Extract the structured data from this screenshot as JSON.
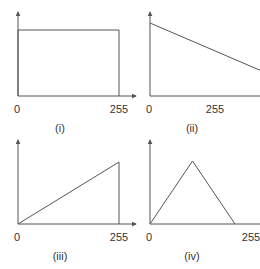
{
  "colors": {
    "axis": "#555555",
    "line": "#555555",
    "text": "#333333",
    "background": "#ffffff"
  },
  "chart_data": [
    {
      "type": "line",
      "caption": "(i)",
      "title": "",
      "xlabel": "",
      "ylabel": "",
      "x_tick_labels": [
        "0",
        "255"
      ],
      "x": [
        0,
        0,
        255,
        255
      ],
      "y": [
        0,
        1,
        1,
        0
      ],
      "xlim": [
        0,
        290
      ],
      "ylim": [
        0,
        1.2
      ],
      "grid": false,
      "description": "constant (uniform) function over 0-255"
    },
    {
      "type": "line",
      "caption": "(ii)",
      "title": "",
      "xlabel": "",
      "ylabel": "",
      "x_tick_labels": [
        "0",
        "255"
      ],
      "x": [
        0,
        510
      ],
      "y": [
        1,
        0
      ],
      "xlim": [
        0,
        580
      ],
      "ylim": [
        0,
        1.2
      ],
      "grid": false,
      "description": "linearly decreasing function reaching zero beyond the 255 tick"
    },
    {
      "type": "line",
      "caption": "(iii)",
      "title": "",
      "xlabel": "",
      "ylabel": "",
      "x_tick_labels": [
        "0",
        "255"
      ],
      "x": [
        0,
        255,
        255
      ],
      "y": [
        0,
        1,
        0
      ],
      "xlim": [
        0,
        290
      ],
      "ylim": [
        0,
        1.2
      ],
      "grid": false,
      "description": "linearly increasing function from 0 to 255"
    },
    {
      "type": "line",
      "caption": "(iv)",
      "title": "",
      "xlabel": "",
      "ylabel": "",
      "x_tick_labels": [
        "0",
        "255"
      ],
      "x": [
        0,
        127.5,
        255
      ],
      "y": [
        0,
        1,
        0
      ],
      "xlim": [
        0,
        290
      ],
      "ylim": [
        0,
        1.2
      ],
      "grid": false,
      "description": "triangular function peaking at mid-range"
    }
  ]
}
